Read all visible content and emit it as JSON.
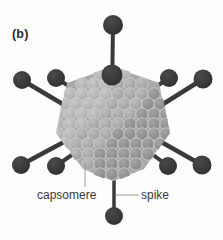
{
  "figure": {
    "panel_label": "(b)",
    "background_color": "#fdfdfd"
  },
  "labels": {
    "capsomere": "capsomere",
    "spike": "spike"
  },
  "colors": {
    "spike_dark": "#3a3a3a",
    "capsomere_fill": "#a9a9a9",
    "capsomere_fill_light": "#b9b9b9",
    "capsomere_fill_dark": "#8e8e8e",
    "capsomere_outline": "#cfcfcf",
    "leader_line": "#9a9a9a",
    "text": "#3a3a3a"
  },
  "structure": {
    "capsid_shape": "icosahedral",
    "capsomere_count_visible": 176,
    "spike_count_visible": 11
  },
  "spikes": [
    {
      "name": "spike-top",
      "knob_x": 113,
      "knob_y": 25,
      "knob_r": 10,
      "base_x": 112,
      "base_y": 74,
      "base_r": 10.5
    },
    {
      "name": "spike-upper-left-outer",
      "knob_x": 22,
      "knob_y": 80,
      "knob_r": 9,
      "base_x": 62,
      "base_y": 103,
      "base_r": 0
    },
    {
      "name": "spike-upper-left-inner",
      "knob_x": 56,
      "knob_y": 78,
      "knob_r": 9,
      "base_x": 75,
      "base_y": 90,
      "base_r": 0
    },
    {
      "name": "spike-upper-right-inner",
      "knob_x": 169,
      "knob_y": 78,
      "knob_r": 9,
      "base_x": 150,
      "base_y": 90,
      "base_r": 0
    },
    {
      "name": "spike-upper-right-outer",
      "knob_x": 203,
      "knob_y": 79,
      "knob_r": 9.5,
      "base_x": 163,
      "base_y": 103,
      "base_r": 0
    },
    {
      "name": "spike-lower-left-outer",
      "knob_x": 21,
      "knob_y": 165,
      "knob_r": 9,
      "base_x": 62,
      "base_y": 144,
      "base_r": 0
    },
    {
      "name": "spike-lower-left-inner",
      "knob_x": 56,
      "knob_y": 166,
      "knob_r": 9,
      "base_x": 83,
      "base_y": 146,
      "base_r": 0
    },
    {
      "name": "spike-lower-right-inner",
      "knob_x": 168,
      "knob_y": 166,
      "knob_r": 9,
      "base_x": 143,
      "base_y": 146,
      "base_r": 0
    },
    {
      "name": "spike-lower-right-outer",
      "knob_x": 202,
      "knob_y": 165,
      "knob_r": 9.5,
      "base_x": 163,
      "base_y": 144,
      "base_r": 0
    },
    {
      "name": "spike-bottom",
      "knob_x": 114,
      "knob_y": 216,
      "knob_r": 9,
      "base_x": 114,
      "base_y": 178,
      "base_r": 0
    }
  ],
  "leaders": [
    {
      "name": "leader-capsomere",
      "x1": 85,
      "y1": 163,
      "x2": 85,
      "y2": 186
    },
    {
      "name": "leader-spike",
      "x1": 115,
      "y1": 195,
      "x2": 139,
      "y2": 195
    }
  ]
}
